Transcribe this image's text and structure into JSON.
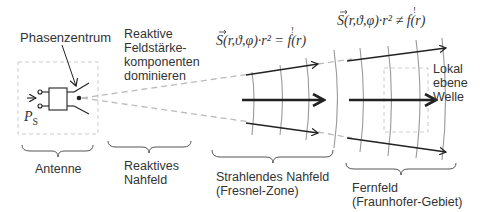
{
  "labels": {
    "phase_center": "Phasenzentrum",
    "reactive_components": "Reaktive\nFeldstärke-\nkomponenten\ndominieren",
    "local_plane_wave": "Lokal\nebene\nWelle",
    "power_symbol": "P",
    "power_subscript": "S"
  },
  "formulas": {
    "near_field": "S(r,ϑ,φ)·r² = f(r)",
    "far_field": "S(r,ϑ,φ)·r² ≠ f(r)",
    "exclamation": "!"
  },
  "regions": [
    {
      "id": "antenna",
      "label": "Antenne"
    },
    {
      "id": "reactive-near-field",
      "label": "Reaktives\nNahfeld"
    },
    {
      "id": "radiating-near-field",
      "label": "Strahlendes Nahfeld\n(Fresnel-Zone)"
    },
    {
      "id": "far-field",
      "label": "Fernfeld\n(Fraunhofer-Gebiet)"
    }
  ],
  "colors": {
    "line": "#222222",
    "wavefront": "#999999",
    "dash": "#bbbbbb",
    "text": "#333333"
  }
}
